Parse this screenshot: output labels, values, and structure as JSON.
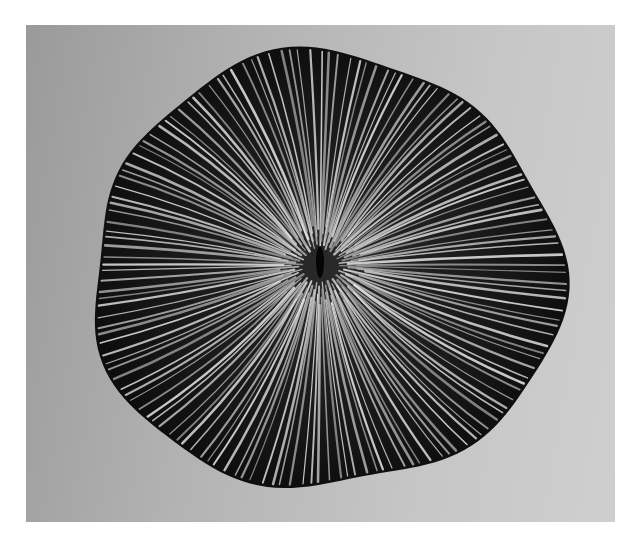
{
  "image": {
    "subject": "mushroom coral skeleton (Fungia), top view",
    "description": "Black-and-white photograph of a disc-shaped mushroom coral with radiating septa converging on a central slit, on a gray gradient background, surrounded by a white border",
    "colors": {
      "border": "#ffffff",
      "background_left": "#9a9a9a",
      "background_right": "#cfcfcf",
      "coral_dark": "#111111",
      "septa_light": "#c9c9c9"
    },
    "photo_frame": {
      "x": 26,
      "y": 25,
      "width": 589,
      "height": 497
    },
    "coral": {
      "center_x": 320,
      "center_y": 265,
      "left": 90,
      "right": 560,
      "top": 55,
      "bottom": 490
    }
  }
}
